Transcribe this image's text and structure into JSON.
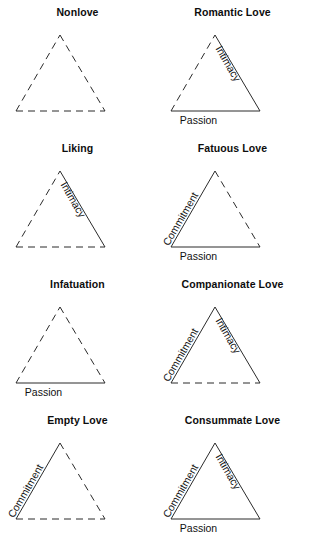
{
  "figure": {
    "title": "",
    "columns": 2,
    "rows": 4
  },
  "labels": {
    "intimacy": "Intimacy",
    "passion": "Passion",
    "commitment": "Commitment"
  },
  "panels": [
    {
      "key": "nonlove",
      "title": "Nonlove",
      "intimacy": false,
      "passion": false,
      "commitment": false,
      "intimacy_label": "",
      "passion_label": "",
      "commitment_label": ""
    },
    {
      "key": "romantic-love",
      "title": "Romantic Love",
      "intimacy": true,
      "passion": true,
      "commitment": false,
      "intimacy_label": "Intimacy",
      "passion_label": "Passion",
      "commitment_label": ""
    },
    {
      "key": "liking",
      "title": "Liking",
      "intimacy": true,
      "passion": false,
      "commitment": false,
      "intimacy_label": "Intimacy",
      "passion_label": "",
      "commitment_label": ""
    },
    {
      "key": "fatuous-love",
      "title": "Fatuous Love",
      "intimacy": false,
      "passion": true,
      "commitment": true,
      "intimacy_label": "",
      "passion_label": "Passion",
      "commitment_label": "Commitment"
    },
    {
      "key": "infatuation",
      "title": "Infatuation",
      "intimacy": false,
      "passion": true,
      "commitment": false,
      "intimacy_label": "",
      "passion_label": "Passion",
      "commitment_label": ""
    },
    {
      "key": "companionate-love",
      "title": "Companionate Love",
      "intimacy": true,
      "passion": false,
      "commitment": true,
      "intimacy_label": "Intimacy",
      "passion_label": "",
      "commitment_label": "Commitment"
    },
    {
      "key": "empty-love",
      "title": "Empty Love",
      "intimacy": false,
      "passion": false,
      "commitment": true,
      "intimacy_label": "",
      "passion_label": "",
      "commitment_label": "Commitment"
    },
    {
      "key": "consummate-love",
      "title": "Consummate Love",
      "intimacy": true,
      "passion": true,
      "commitment": true,
      "intimacy_label": "Intimacy",
      "passion_label": "Passion",
      "commitment_label": "Commitment"
    }
  ],
  "colors": {
    "stroke": "#2b2b2b",
    "text": "#111111",
    "background": "#ffffff"
  }
}
